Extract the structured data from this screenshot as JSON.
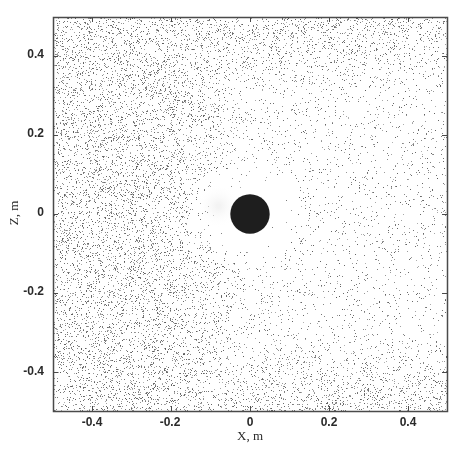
{
  "chart_data": {
    "type": "scatter",
    "title": "",
    "xlabel": "X, m",
    "ylabel": "Z, m",
    "xlim": [
      -0.5,
      0.5
    ],
    "ylim": [
      -0.5,
      0.5
    ],
    "xticks": [
      -0.4,
      -0.2,
      0,
      0.2,
      0.4
    ],
    "yticks": [
      -0.4,
      -0.2,
      0,
      0.2,
      0.4
    ],
    "xtick_labels": [
      "-0.4",
      "-0.2",
      "0",
      "0.2",
      "0.4"
    ],
    "ytick_labels": [
      "-0.4",
      "-0.2",
      "0",
      "0.2",
      "0.4"
    ],
    "grid": false,
    "legend": null,
    "obstacle": {
      "shape": "circle",
      "center": [
        0,
        0
      ],
      "radius": 0.05,
      "color": "#1e1e1e"
    },
    "particles": {
      "description": "Particle positions around a circular obstacle; dense upstream (left) and near top/bottom edges, sparse wake region downstream (right) of the obstacle",
      "approx_count": 12000,
      "marker_color": "#555555",
      "marker_size_px": 1,
      "density_profile": {
        "upstream_left": "high",
        "top_bottom_edges": "high",
        "downstream_wake": "very low",
        "wake_half_width_grows_with_x": true
      }
    }
  },
  "colors": {
    "axes": "#4a4a4a",
    "text": "#2a2a2a",
    "background": "#ffffff"
  },
  "layout": {
    "plot_left": 53,
    "plot_top": 17,
    "plot_right": 447,
    "plot_bottom": 411
  }
}
